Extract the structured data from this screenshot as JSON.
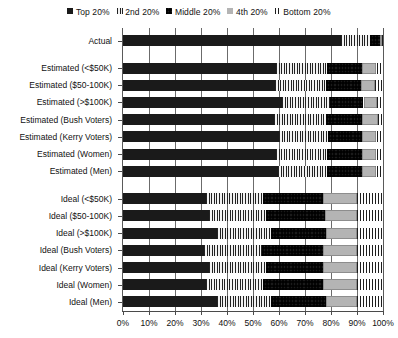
{
  "legend": {
    "position": "top-center",
    "items": [
      {
        "label": "Top 20%",
        "key": "top",
        "color": "#1a1a1a",
        "pattern": "solid-black"
      },
      {
        "label": "2nd 20%",
        "key": "second",
        "color": "#222222",
        "pattern": "vertical-stripes"
      },
      {
        "label": "Middle 20%",
        "key": "middle",
        "color": "#2b2b2b",
        "pattern": "dotted-dark"
      },
      {
        "label": "4th 20%",
        "key": "fourth",
        "color": "#b4b4b4",
        "pattern": "solid-light-gray"
      },
      {
        "label": "Bottom 20%",
        "key": "bottom",
        "color": "#1d1d1d",
        "pattern": "crosshatch"
      }
    ]
  },
  "axis": {
    "x": {
      "ticks": [
        "0%",
        "10%",
        "20%",
        "30%",
        "40%",
        "50%",
        "60%",
        "70%",
        "80%",
        "90%",
        "100%"
      ],
      "min": 0,
      "max": 100,
      "grid": true
    },
    "y": {
      "categories": [
        "Actual",
        "Estimated (<$50K)",
        "Estimated ($50-100K)",
        "Estimated (>$100K)",
        "Estimated (Bush Voters)",
        "Estimated (Kerry Voters)",
        "Estimated (Women)",
        "Estimated (Men)",
        "Ideal (<$50K)",
        "Ideal ($50-100K)",
        "Ideal (>$100K)",
        "Ideal (Bush Voters)",
        "Ideal (Kerry Voters)",
        "Ideal (Women)",
        "Ideal (Men)"
      ]
    }
  },
  "chart_data": {
    "type": "bar",
    "orientation": "horizontal",
    "stacked": true,
    "normalized_percent": true,
    "title": "",
    "xlabel": "",
    "ylabel": "",
    "xlim": [
      0,
      100
    ],
    "grid": true,
    "legend_position": "top-center",
    "categories": [
      "Actual",
      "Estimated (<$50K)",
      "Estimated ($50-100K)",
      "Estimated (>$100K)",
      "Estimated (Bush Voters)",
      "Estimated (Kerry Voters)",
      "Estimated (Women)",
      "Estimated (Men)",
      "Ideal (<$50K)",
      "Ideal ($50-100K)",
      "Ideal (>$100K)",
      "Ideal (Bush Voters)",
      "Ideal (Kerry Voters)",
      "Ideal (Women)",
      "Ideal (Men)"
    ],
    "series": [
      {
        "name": "Top 20%",
        "values": [
          84.0,
          59.0,
          58.5,
          61.0,
          58.0,
          60.0,
          59.0,
          59.5,
          32.0,
          33.0,
          36.0,
          31.0,
          33.0,
          32.0,
          36.0
        ]
      },
      {
        "name": "2nd 20%",
        "values": [
          11.0,
          19.5,
          19.5,
          18.5,
          20.0,
          19.0,
          19.5,
          19.0,
          22.0,
          22.0,
          21.0,
          22.5,
          22.0,
          22.0,
          21.0
        ]
      },
      {
        "name": "Middle 20%",
        "values": [
          4.0,
          13.5,
          13.5,
          13.0,
          14.0,
          13.0,
          13.5,
          13.5,
          23.0,
          22.5,
          21.0,
          23.5,
          22.0,
          23.0,
          21.0
        ]
      },
      {
        "name": "4th 20%",
        "values": [
          0.7,
          5.5,
          5.5,
          5.0,
          6.0,
          5.5,
          5.5,
          5.5,
          13.0,
          12.5,
          12.0,
          13.0,
          13.0,
          13.0,
          12.0
        ]
      },
      {
        "name": "Bottom 20%",
        "values": [
          0.3,
          2.5,
          3.0,
          2.5,
          2.0,
          2.5,
          2.5,
          2.5,
          10.0,
          10.0,
          10.0,
          10.0,
          10.0,
          10.0,
          10.0
        ]
      }
    ]
  }
}
